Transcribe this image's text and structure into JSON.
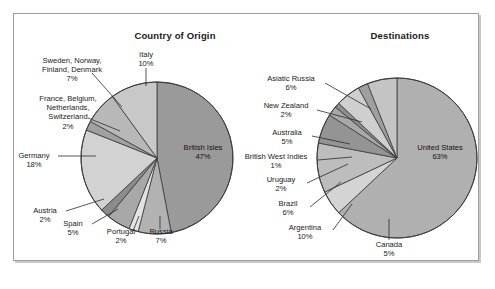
{
  "figure": {
    "background": "#ffffff",
    "frame_border_color": "#9d9d9d"
  },
  "charts": {
    "origin": {
      "title": "Country of Origin",
      "center_label": {
        "name": "British Isles",
        "pct": "47%"
      }
    },
    "destinations": {
      "title": "Destinations",
      "center_label": {
        "name": "United States",
        "pct": "63%"
      }
    }
  },
  "labels": {
    "origin": {
      "scandinavia": {
        "l1": "Sweden, Norway,",
        "l2": "Finland, Denmark",
        "pct": "7%"
      },
      "italy": {
        "l1": "Italy",
        "pct": "10%"
      },
      "lowlands": {
        "l1": "France, Belgium,",
        "l2": "Netherlands,",
        "l3": "Switzerland",
        "pct": "2%"
      },
      "germany": {
        "l1": "Germany",
        "pct": "18%"
      },
      "austria": {
        "l1": "Austria",
        "pct": "2%"
      },
      "spain": {
        "l1": "Spain",
        "pct": "5%"
      },
      "portugal": {
        "l1": "Portugal",
        "pct": "2%"
      },
      "russia": {
        "l1": "Russia",
        "pct": "7%"
      }
    },
    "destinations": {
      "asiatic_russia": {
        "l1": "Asiatic Russia",
        "pct": "6%"
      },
      "new_zealand": {
        "l1": "New Zealand",
        "pct": "2%"
      },
      "australia": {
        "l1": "Australia",
        "pct": "5%"
      },
      "british_west_indies": {
        "l1": "British West Indies",
        "pct": "1%"
      },
      "uruguay": {
        "l1": "Uruguay",
        "pct": "2%"
      },
      "brazil": {
        "l1": "Brazil",
        "pct": "6%"
      },
      "argentina": {
        "l1": "Argentina",
        "pct": "10%"
      },
      "canada": {
        "l1": "Canada",
        "pct": "5%"
      }
    }
  },
  "chart_data": [
    {
      "type": "pie",
      "title": "Country of Origin",
      "categories": [
        "British Isles",
        "Russia",
        "Portugal",
        "Spain",
        "Austria",
        "Germany",
        "France, Belgium, Netherlands, Switzerland",
        "Sweden, Norway, Finland, Denmark",
        "Italy"
      ],
      "values": [
        47,
        7,
        2,
        5,
        2,
        18,
        2,
        7,
        10
      ],
      "unit": "percent",
      "start_angle_deg": 0,
      "direction": "clockwise",
      "colors": [
        "#9a9a9a",
        "#b2b2b2",
        "#e3e3e3",
        "#a8a8a8",
        "#8b8b8b",
        "#d2d2d2",
        "#a0a0a0",
        "#b8b8b8",
        "#c8c8c8"
      ],
      "legend": "none",
      "labels_placement": "callout"
    },
    {
      "type": "pie",
      "title": "Destinations",
      "categories": [
        "United States",
        "Canada",
        "Argentina",
        "Brazil",
        "Uruguay",
        "British West Indies",
        "Australia",
        "New Zealand",
        "Asiatic Russia"
      ],
      "values": [
        63,
        5,
        10,
        6,
        2,
        1,
        5,
        2,
        6
      ],
      "unit": "percent",
      "start_angle_deg": 0,
      "direction": "clockwise",
      "colors": [
        "#b0b0b0",
        "#d4d4d4",
        "#bdbdbd",
        "#949494",
        "#a8a8a8",
        "#8d8d8d",
        "#cfcfcf",
        "#9f9f9f",
        "#c4c4c4"
      ],
      "legend": "none",
      "labels_placement": "callout"
    }
  ]
}
